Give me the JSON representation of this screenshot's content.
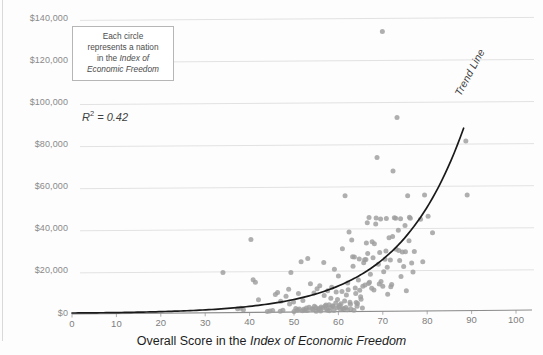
{
  "chart_data": {
    "type": "scatter",
    "title": "",
    "xlabel": "Overall Score in the Index of Economic Freedom",
    "ylabel": "",
    "xlim": [
      0,
      100
    ],
    "ylim": [
      0,
      145000
    ],
    "grid": true,
    "legend": "none",
    "xticks": [
      "0",
      "10",
      "20",
      "30",
      "40",
      "50",
      "60",
      "70",
      "80",
      "90",
      "100"
    ],
    "xtick_values": [
      0,
      10,
      20,
      30,
      40,
      50,
      60,
      70,
      80,
      90,
      100
    ],
    "yticks": [
      "$0",
      "$20,000",
      "$40,000",
      "$60,000",
      "$80,000",
      "$100,000",
      "$120,000",
      "$140,000"
    ],
    "ytick_values": [
      0,
      20000,
      40000,
      60000,
      80000,
      100000,
      120000,
      140000
    ],
    "marker_color": "#9d9d9d",
    "trendline_color": "#1a1a1a",
    "r_squared": 0.42,
    "trendline_type": "exponential",
    "trendline_note": "Trend Line",
    "points": [
      [
        34.0,
        19500
      ],
      [
        37.3,
        2200
      ],
      [
        38.0,
        2500
      ],
      [
        38.6,
        1800
      ],
      [
        40.3,
        35200
      ],
      [
        40.8,
        16000
      ],
      [
        41.3,
        14800
      ],
      [
        42.0,
        6500
      ],
      [
        44.6,
        1200
      ],
      [
        45.2,
        1400
      ],
      [
        45.8,
        9000
      ],
      [
        46.3,
        10000
      ],
      [
        46.9,
        1100
      ],
      [
        47.5,
        1500
      ],
      [
        48.2,
        8200
      ],
      [
        48.8,
        11500
      ],
      [
        49.3,
        19500
      ],
      [
        49.9,
        5500
      ],
      [
        50.4,
        2400
      ],
      [
        50.8,
        1700
      ],
      [
        51.2,
        2100
      ],
      [
        51.6,
        24600
      ],
      [
        51.9,
        1300
      ],
      [
        52.2,
        2000
      ],
      [
        52.5,
        1600
      ],
      [
        52.8,
        2600
      ],
      [
        53.1,
        26200
      ],
      [
        53.4,
        3000
      ],
      [
        53.7,
        14200
      ],
      [
        54.0,
        2300
      ],
      [
        54.3,
        1900
      ],
      [
        54.6,
        3400
      ],
      [
        54.9,
        2800
      ],
      [
        55.2,
        11800
      ],
      [
        55.5,
        2000
      ],
      [
        55.8,
        13200
      ],
      [
        56.1,
        3100
      ],
      [
        56.4,
        2500
      ],
      [
        56.7,
        24300
      ],
      [
        57.0,
        3600
      ],
      [
        57.3,
        2200
      ],
      [
        57.6,
        10800
      ],
      [
        57.9,
        4200
      ],
      [
        58.2,
        2900
      ],
      [
        58.5,
        12500
      ],
      [
        58.8,
        3300
      ],
      [
        59.1,
        21000
      ],
      [
        59.4,
        5000
      ],
      [
        59.7,
        2700
      ],
      [
        60.0,
        17800
      ],
      [
        60.3,
        3900
      ],
      [
        60.6,
        4600
      ],
      [
        60.9,
        30800
      ],
      [
        61.2,
        2400
      ],
      [
        61.5,
        56000
      ],
      [
        61.8,
        8800
      ],
      [
        62.1,
        14500
      ],
      [
        62.4,
        38800
      ],
      [
        62.7,
        4400
      ],
      [
        63.0,
        35000
      ],
      [
        63.3,
        22500
      ],
      [
        63.6,
        26900
      ],
      [
        63.9,
        9500
      ],
      [
        64.2,
        3500
      ],
      [
        64.5,
        15900
      ],
      [
        64.8,
        11000
      ],
      [
        65.1,
        6800
      ],
      [
        65.4,
        2600
      ],
      [
        65.7,
        24100
      ],
      [
        66.0,
        13500
      ],
      [
        66.3,
        33500
      ],
      [
        66.6,
        28500
      ],
      [
        66.9,
        45600
      ],
      [
        67.2,
        18700
      ],
      [
        67.5,
        12000
      ],
      [
        67.8,
        26500
      ],
      [
        68.1,
        33200
      ],
      [
        68.4,
        42600
      ],
      [
        68.7,
        74200
      ],
      [
        69.0,
        23400
      ],
      [
        69.3,
        29000
      ],
      [
        69.6,
        15200
      ],
      [
        69.9,
        134000
      ],
      [
        70.2,
        19800
      ],
      [
        70.5,
        25800
      ],
      [
        70.8,
        45200
      ],
      [
        71.1,
        9200
      ],
      [
        71.4,
        36000
      ],
      [
        71.7,
        25400
      ],
      [
        72.0,
        13800
      ],
      [
        72.3,
        67800
      ],
      [
        72.6,
        45500
      ],
      [
        72.9,
        45300
      ],
      [
        73.2,
        93200
      ],
      [
        73.5,
        39600
      ],
      [
        73.8,
        25200
      ],
      [
        74.1,
        17600
      ],
      [
        74.4,
        29200
      ],
      [
        74.7,
        22300
      ],
      [
        75.0,
        41800
      ],
      [
        75.3,
        10800
      ],
      [
        75.6,
        56000
      ],
      [
        75.9,
        34600
      ],
      [
        76.2,
        45300
      ],
      [
        76.5,
        24000
      ],
      [
        76.8,
        19700
      ],
      [
        77.1,
        29500
      ],
      [
        78.5,
        44800
      ],
      [
        79.0,
        24600
      ],
      [
        79.4,
        56300
      ],
      [
        80.2,
        46200
      ],
      [
        81.2,
        38400
      ],
      [
        88.7,
        82000
      ],
      [
        89.0,
        56300
      ],
      [
        62.0,
        1800
      ],
      [
        63.5,
        1500
      ],
      [
        64.0,
        5200
      ],
      [
        59.0,
        1400
      ],
      [
        56.0,
        1200
      ],
      [
        57.5,
        1600
      ],
      [
        50.0,
        1000
      ],
      [
        44.0,
        900
      ],
      [
        62.8,
        2100
      ],
      [
        65.0,
        8000
      ],
      [
        67.0,
        14800
      ],
      [
        68.0,
        11200
      ],
      [
        70.0,
        13000
      ],
      [
        71.0,
        22000
      ],
      [
        73.0,
        30500
      ],
      [
        74.0,
        45100
      ],
      [
        76.0,
        45700
      ],
      [
        68.5,
        45400
      ],
      [
        69.5,
        44900
      ],
      [
        66.5,
        43200
      ],
      [
        58.0,
        1300
      ],
      [
        60.5,
        1900
      ],
      [
        61.0,
        2200
      ],
      [
        55.0,
        1100
      ],
      [
        53.0,
        1400
      ],
      [
        51.0,
        9500
      ],
      [
        52.0,
        6200
      ],
      [
        47.0,
        5800
      ],
      [
        49.0,
        4500
      ],
      [
        63.2,
        27000
      ],
      [
        64.7,
        25900
      ],
      [
        65.9,
        25500
      ],
      [
        66.2,
        25700
      ],
      [
        67.6,
        34100
      ],
      [
        70.7,
        29700
      ],
      [
        72.2,
        36600
      ],
      [
        73.6,
        29900
      ],
      [
        75.1,
        29300
      ],
      [
        54.5,
        9800
      ],
      [
        56.8,
        8500
      ],
      [
        58.3,
        7200
      ],
      [
        59.8,
        6600
      ],
      [
        61.4,
        5900
      ],
      [
        62.6,
        5300
      ],
      [
        64.3,
        4800
      ],
      [
        66.8,
        14300
      ],
      [
        69.2,
        14000
      ],
      [
        71.8,
        12700
      ],
      [
        59.5,
        10200
      ],
      [
        60.8,
        10500
      ],
      [
        62.2,
        11300
      ],
      [
        63.8,
        12100
      ],
      [
        65.5,
        12900
      ],
      [
        57.2,
        4000
      ],
      [
        58.7,
        3700
      ],
      [
        60.1,
        3200
      ],
      [
        61.7,
        2800
      ],
      [
        55.7,
        2400
      ]
    ]
  },
  "annotation": {
    "line1": "Each circle",
    "line2": "represents a nation",
    "line3_prefix": "in the ",
    "line3_italic": "Index of",
    "line4_italic": "Economic Freedom"
  },
  "r_squared_label": {
    "symbol": "R",
    "exponent": "2",
    "equals": " = 0.42"
  },
  "trend_label": "Trend Line",
  "xaxis_title": {
    "prefix": "Overall Score in the ",
    "italic": "Index of Economic Freedom"
  }
}
